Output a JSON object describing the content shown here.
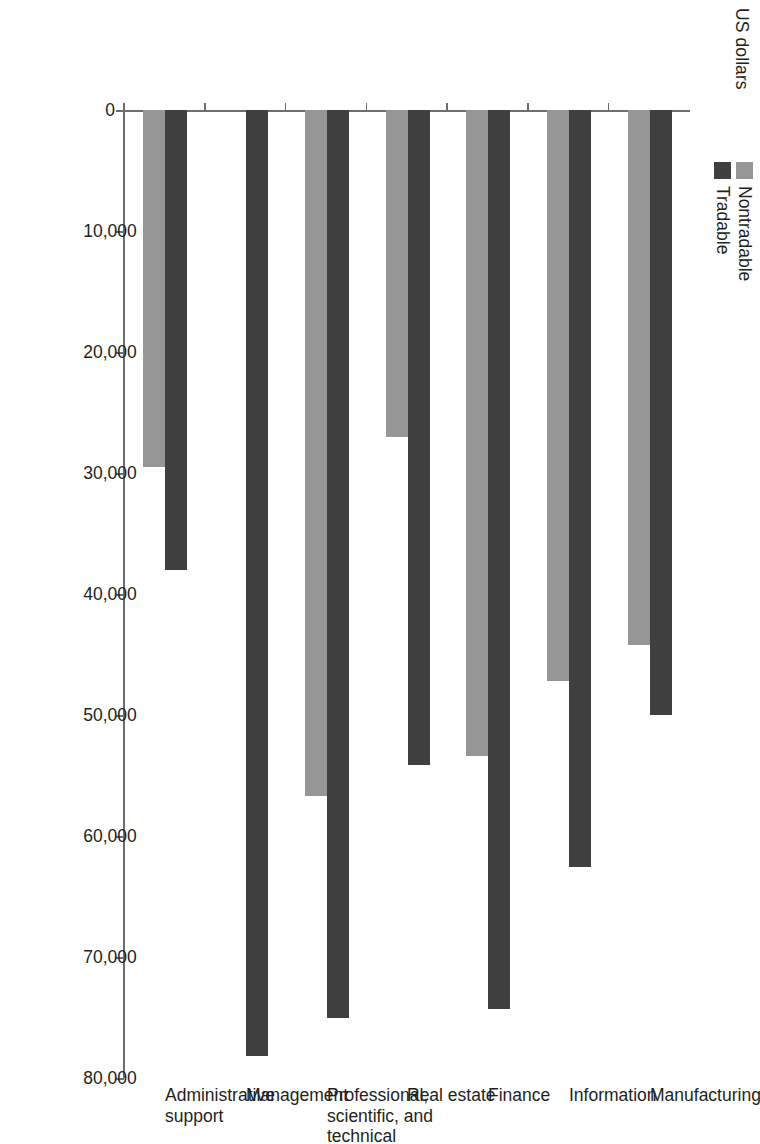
{
  "chart_data": {
    "type": "bar",
    "orientation": "horizontal",
    "title": "",
    "xlabel": "US dollars",
    "ylabel": "",
    "axis_title": "US dollars",
    "categories": [
      "Manufacturing",
      "Information",
      "Finance",
      "Real estate",
      "Professional,\nscientific, and\ntechnical",
      "Management",
      "Administrative\nsupport"
    ],
    "series": [
      {
        "name": "Nontradable",
        "color": "#969696",
        "values": [
          44200,
          47200,
          53400,
          27000,
          56700,
          null,
          29500
        ]
      },
      {
        "name": "Tradable",
        "color": "#3f3f3f",
        "values": [
          50000,
          62600,
          74300,
          54100,
          75000,
          78200,
          38000
        ]
      }
    ],
    "value_axis": {
      "min": 0,
      "max": 80000,
      "tick_step": 10000,
      "tick_labels": [
        "0",
        "10,000",
        "20,000",
        "30,000",
        "40,000",
        "50,000",
        "60,000",
        "70,000",
        "80,000"
      ],
      "tick_values": [
        0,
        10000,
        20000,
        30000,
        40000,
        50000,
        60000,
        70000,
        80000
      ]
    },
    "grid": false,
    "legend": {
      "position": "top-left",
      "entries": [
        {
          "label": "Nontradable",
          "color": "#969696"
        },
        {
          "label": "Tradable",
          "color": "#3f3f3f"
        }
      ]
    },
    "colors": {
      "nontradable": "#969696",
      "tradable": "#3f3f3f",
      "axis": "#6d6e71",
      "text": "#231f20",
      "background": "#ffffff"
    }
  }
}
